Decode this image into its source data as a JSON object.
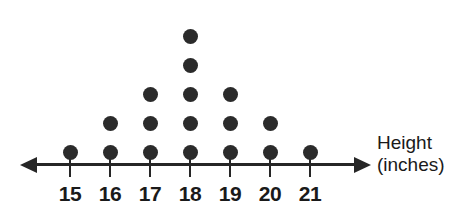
{
  "chart_data": {
    "type": "bar",
    "chart_subtype": "dot-plot",
    "title": "",
    "subtitle": "",
    "xlabel": "Height (inches)",
    "ylabel": "",
    "categories": [
      "15",
      "16",
      "17",
      "18",
      "19",
      "20",
      "21"
    ],
    "values": [
      1,
      2,
      3,
      5,
      3,
      2,
      1
    ],
    "total_count": 17,
    "xlim": [
      15,
      21
    ],
    "ylim": [
      0,
      5
    ],
    "grid": false,
    "legend": null,
    "annotations": [],
    "axis_style": "double-headed-arrow-number-line",
    "dot_color": "#2b2b2b",
    "axis_color": "#262626"
  },
  "axis": {
    "title_line1": "Height",
    "title_line2": "(inches)",
    "ticks": [
      "15",
      "16",
      "17",
      "18",
      "19",
      "20",
      "21"
    ]
  },
  "colors": {
    "dot": "#2b2b2b",
    "axis": "#262626",
    "text": "#1a1a1a",
    "background": "#ffffff"
  }
}
